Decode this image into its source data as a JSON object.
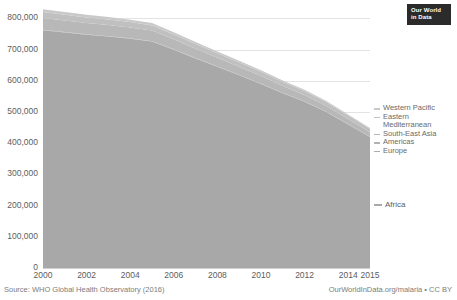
{
  "logo": {
    "line1": "Our World",
    "line2": "in Data"
  },
  "footer": {
    "source": "Source: WHO Global Health Observatory (2016)",
    "license": "OurWorldInData.org/malaria • CC BY"
  },
  "legend": {
    "items": [
      {
        "label": "Western Pacific",
        "color": "#c9c9c9"
      },
      {
        "label": "Eastern Mediterranean",
        "color": "#c0c0c0"
      },
      {
        "label": "South-East Asia",
        "color": "#b8b8b8"
      },
      {
        "label": "Americas",
        "color": "#b2b2b2"
      },
      {
        "label": "Europe",
        "color": "#adadad"
      }
    ],
    "africa": {
      "label": "Africa",
      "color": "#a8a8a8"
    }
  },
  "chart_data": {
    "type": "area",
    "stacked": true,
    "title": "",
    "subtitle": "",
    "xlabel": "",
    "ylabel": "",
    "xlim": [
      2000,
      2015
    ],
    "ylim": [
      0,
      840000
    ],
    "grid": true,
    "legend_position": "right",
    "x": [
      2000,
      2001,
      2002,
      2003,
      2004,
      2005,
      2006,
      2007,
      2008,
      2009,
      2010,
      2011,
      2012,
      2013,
      2014,
      2015
    ],
    "xticks": [
      "2000",
      "2002",
      "2004",
      "2006",
      "2008",
      "2010",
      "2012",
      "2014",
      "2015"
    ],
    "xtick_values": [
      2000,
      2002,
      2004,
      2006,
      2008,
      2010,
      2012,
      2014,
      2015
    ],
    "yticks": [
      "0",
      "100,000",
      "200,000",
      "300,000",
      "400,000",
      "500,000",
      "600,000",
      "700,000",
      "800,000"
    ],
    "ytick_values": [
      0,
      100000,
      200000,
      300000,
      400000,
      500000,
      600000,
      700000,
      800000
    ],
    "series": [
      {
        "name": "Africa",
        "color": "#a8a8a8",
        "values": [
          762000,
          755000,
          748000,
          742000,
          735000,
          726000,
          700000,
          672000,
          645000,
          618000,
          590000,
          560000,
          533000,
          500000,
          460000,
          420000
        ]
      },
      {
        "name": "Europe",
        "color": "#adadad",
        "values": [
          200,
          180,
          160,
          140,
          120,
          100,
          80,
          60,
          40,
          30,
          20,
          10,
          5,
          2,
          1,
          0
        ]
      },
      {
        "name": "Americas",
        "color": "#b2b2b2",
        "values": [
          1400,
          1350,
          1300,
          1250,
          1200,
          1100,
          1000,
          950,
          900,
          850,
          800,
          750,
          700,
          650,
          600,
          550
        ]
      },
      {
        "name": "South-East Asia",
        "color": "#b8b8b8",
        "values": [
          38000,
          37000,
          36000,
          35500,
          35000,
          34000,
          32000,
          30000,
          28000,
          26000,
          25000,
          23000,
          21000,
          19000,
          17000,
          15000
        ]
      },
      {
        "name": "Eastern Mediterranean",
        "color": "#c0c0c0",
        "values": [
          19000,
          18500,
          18000,
          17500,
          17000,
          16500,
          15500,
          15000,
          14500,
          14000,
          13500,
          13000,
          12500,
          12000,
          11500,
          11000
        ]
      },
      {
        "name": "Western Pacific",
        "color": "#c9c9c9",
        "values": [
          9000,
          8700,
          8400,
          8100,
          7800,
          7400,
          7000,
          6500,
          6000,
          5500,
          5000,
          4500,
          4000,
          3500,
          3000,
          2500
        ]
      }
    ],
    "totals": [
      829600,
      820730,
      811860,
      804490,
      796120,
      785100,
      755580,
      724510,
      694440,
      664380,
      634320,
      601260,
      571205,
      535152,
      492101,
      449050
    ]
  }
}
